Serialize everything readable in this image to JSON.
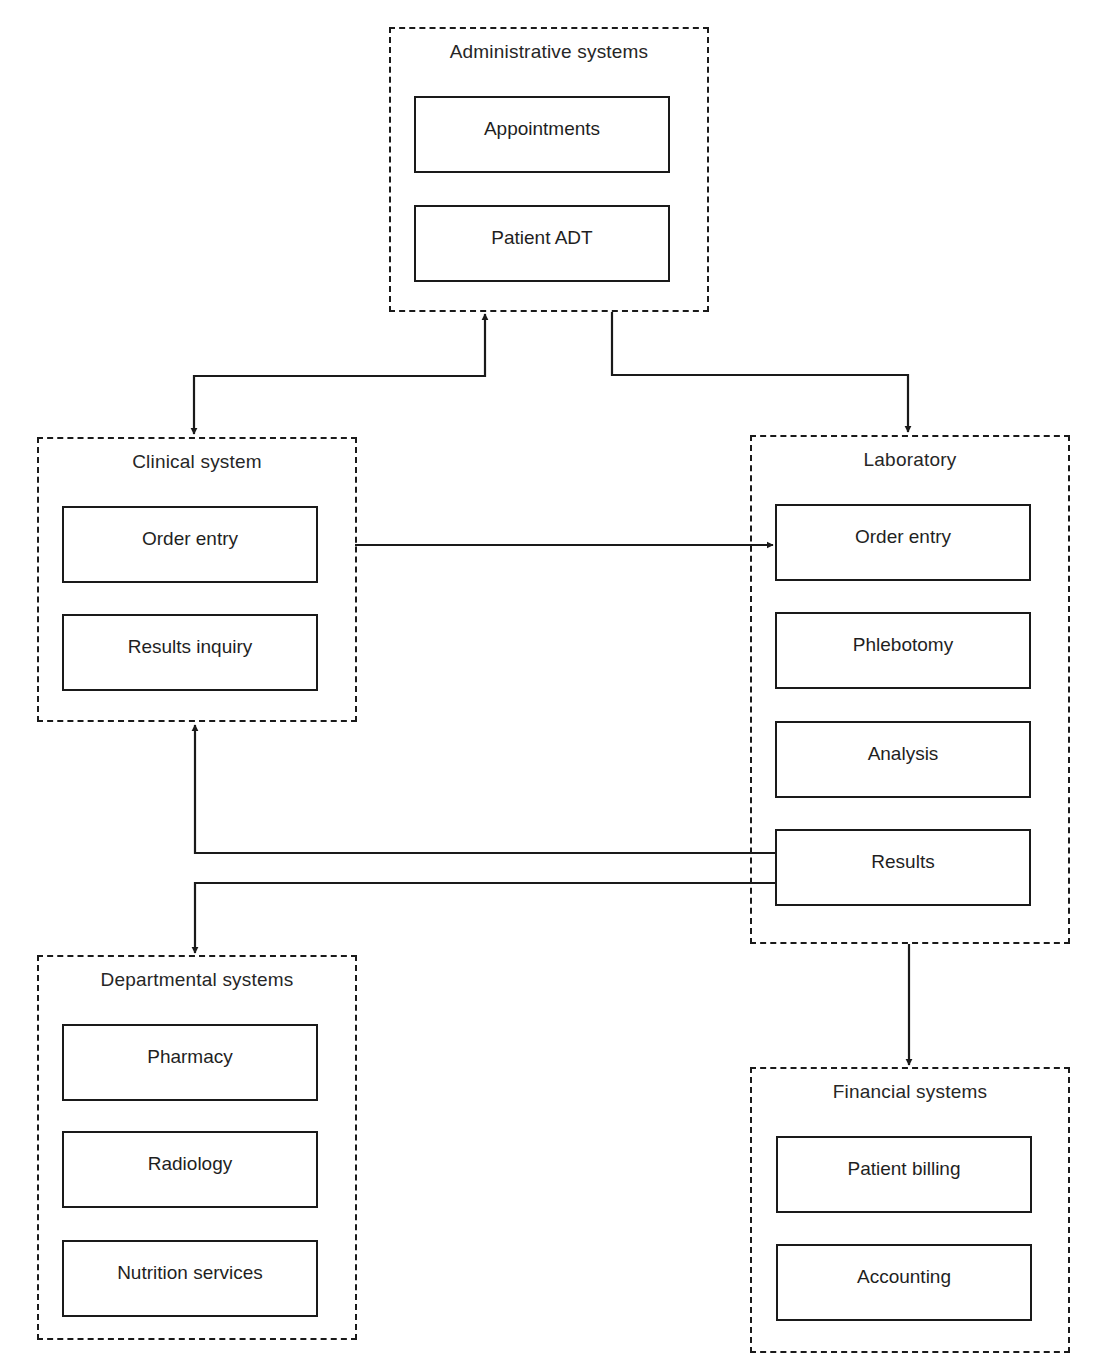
{
  "diagram": {
    "groups": {
      "administrative": {
        "title": "Administrative systems",
        "nodes": [
          "Appointments",
          "Patient ADT"
        ]
      },
      "clinical": {
        "title": "Clinical system",
        "nodes": [
          "Order entry",
          "Results inquiry"
        ]
      },
      "laboratory": {
        "title": "Laboratory",
        "nodes": [
          "Order entry",
          "Phlebotomy",
          "Analysis",
          "Results"
        ]
      },
      "departmental": {
        "title": "Departmental systems",
        "nodes": [
          "Pharmacy",
          "Radiology",
          "Nutrition services"
        ]
      },
      "financial": {
        "title": "Financial systems",
        "nodes": [
          "Patient billing",
          "Accounting"
        ]
      }
    },
    "edges": [
      {
        "from": "Administrative systems",
        "to": "Clinical system",
        "direction": "bidirectional"
      },
      {
        "from": "Administrative systems",
        "to": "Laboratory",
        "direction": "forward"
      },
      {
        "from": "Clinical system / Order entry",
        "to": "Laboratory / Order entry",
        "direction": "forward"
      },
      {
        "from": "Laboratory / Results",
        "to": "Clinical system",
        "direction": "forward"
      },
      {
        "from": "Laboratory / Results",
        "to": "Departmental systems",
        "direction": "forward"
      },
      {
        "from": "Laboratory",
        "to": "Financial systems",
        "direction": "forward"
      }
    ],
    "colors": {
      "line": "#1a1a1a",
      "background": "#ffffff"
    }
  }
}
